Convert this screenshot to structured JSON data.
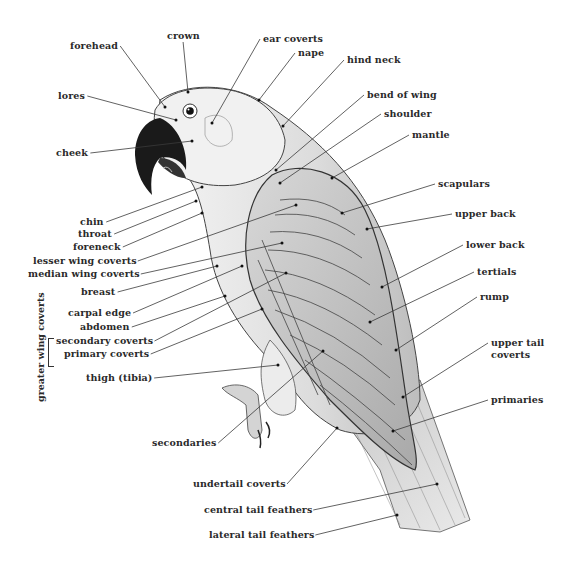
{
  "diagram": {
    "colors": {
      "ink": "#2a2a2a",
      "beak": "#1a1a1a",
      "feather_light": "#e6e6e6",
      "feather_mid": "#c9c9c9",
      "feather_dark": "#9a9a9a"
    },
    "group_label": "greater wing coverts",
    "labels": [
      {
        "id": "crown",
        "text": "crown",
        "x": 167,
        "y": 36,
        "align": "l",
        "tx": 188,
        "ty": 92
      },
      {
        "id": "forehead",
        "text": "forehead",
        "x": 70,
        "y": 46,
        "align": "l",
        "tx": 165,
        "ty": 107
      },
      {
        "id": "ear-coverts",
        "text": "ear coverts",
        "x": 263,
        "y": 39,
        "align": "l",
        "tx": 212,
        "ty": 123
      },
      {
        "id": "nape",
        "text": "nape",
        "x": 298,
        "y": 53,
        "align": "l",
        "tx": 259,
        "ty": 100
      },
      {
        "id": "hind-neck",
        "text": "hind neck",
        "x": 347,
        "y": 60,
        "align": "l",
        "tx": 283,
        "ty": 126
      },
      {
        "id": "lores",
        "text": "lores",
        "x": 58,
        "y": 96,
        "align": "l",
        "tx": 176,
        "ty": 120
      },
      {
        "id": "bend-of-wing",
        "text": "bend of wing",
        "x": 367,
        "y": 95,
        "align": "l",
        "tx": 276,
        "ty": 170
      },
      {
        "id": "shoulder",
        "text": "shoulder",
        "x": 384,
        "y": 114,
        "align": "l",
        "tx": 280,
        "ty": 183
      },
      {
        "id": "mantle",
        "text": "mantle",
        "x": 412,
        "y": 135,
        "align": "l",
        "tx": 332,
        "ty": 178
      },
      {
        "id": "cheek",
        "text": "cheek",
        "x": 56,
        "y": 153,
        "align": "l",
        "tx": 192,
        "ty": 141
      },
      {
        "id": "scapulars",
        "text": "scapulars",
        "x": 438,
        "y": 184,
        "align": "l",
        "tx": 342,
        "ty": 213
      },
      {
        "id": "upper-back",
        "text": "upper back",
        "x": 455,
        "y": 214,
        "align": "l",
        "tx": 367,
        "ty": 229
      },
      {
        "id": "chin",
        "text": "chin",
        "x": 80,
        "y": 222,
        "align": "l",
        "tx": 202,
        "ty": 187
      },
      {
        "id": "throat",
        "text": "throat",
        "x": 78,
        "y": 234,
        "align": "l",
        "tx": 196,
        "ty": 201
      },
      {
        "id": "foreneck",
        "text": "foreneck",
        "x": 73,
        "y": 247,
        "align": "l",
        "tx": 202,
        "ty": 213
      },
      {
        "id": "lower-back",
        "text": "lower back",
        "x": 466,
        "y": 245,
        "align": "l",
        "tx": 382,
        "ty": 287
      },
      {
        "id": "lesser-wing-coverts",
        "text": "lesser wing coverts",
        "x": 33,
        "y": 261,
        "align": "l",
        "tx": 296,
        "ty": 205
      },
      {
        "id": "median-wing-coverts",
        "text": "median wing coverts",
        "x": 28,
        "y": 274,
        "align": "l",
        "tx": 282,
        "ty": 243
      },
      {
        "id": "tertials",
        "text": "tertials",
        "x": 477,
        "y": 272,
        "align": "l",
        "tx": 370,
        "ty": 322
      },
      {
        "id": "breast",
        "text": "breast",
        "x": 81,
        "y": 292,
        "align": "l",
        "tx": 217,
        "ty": 266
      },
      {
        "id": "rump",
        "text": "rump",
        "x": 480,
        "y": 297,
        "align": "l",
        "tx": 396,
        "ty": 350
      },
      {
        "id": "carpal-edge",
        "text": "carpal edge",
        "x": 68,
        "y": 313,
        "align": "l",
        "tx": 242,
        "ty": 266
      },
      {
        "id": "abdomen",
        "text": "abdomen",
        "x": 80,
        "y": 327,
        "align": "l",
        "tx": 225,
        "ty": 296
      },
      {
        "id": "upper-tail-coverts",
        "text": "upper tail",
        "x": 491,
        "y": 343,
        "align": "l",
        "tx": 403,
        "ty": 397
      },
      {
        "id": "upper-tail-coverts-2",
        "text": "coverts",
        "x": 491,
        "y": 355,
        "align": "l",
        "tx": null,
        "ty": null
      },
      {
        "id": "secondary-coverts",
        "text": "secondary coverts",
        "x": 56,
        "y": 341,
        "align": "l",
        "tx": 286,
        "ty": 273
      },
      {
        "id": "primary-coverts",
        "text": "primary coverts",
        "x": 64,
        "y": 354,
        "align": "l",
        "tx": 262,
        "ty": 309
      },
      {
        "id": "thigh",
        "text": "thigh (tibia)",
        "x": 86,
        "y": 378,
        "align": "l",
        "tx": 278,
        "ty": 365
      },
      {
        "id": "primaries",
        "text": "primaries",
        "x": 491,
        "y": 400,
        "align": "l",
        "tx": 393,
        "ty": 431
      },
      {
        "id": "secondaries",
        "text": "secondaries",
        "x": 152,
        "y": 443,
        "align": "l",
        "tx": 323,
        "ty": 351
      },
      {
        "id": "undertail-coverts",
        "text": "undertail coverts",
        "x": 193,
        "y": 484,
        "align": "l",
        "tx": 337,
        "ty": 428
      },
      {
        "id": "central-tail-feathers",
        "text": "central tail feathers",
        "x": 204,
        "y": 510,
        "align": "l",
        "tx": 437,
        "ty": 484
      },
      {
        "id": "lateral-tail-feathers",
        "text": "lateral tail feathers",
        "x": 209,
        "y": 535,
        "align": "l",
        "tx": 397,
        "ty": 515
      }
    ]
  }
}
